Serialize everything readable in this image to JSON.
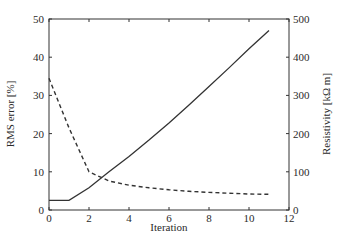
{
  "chart_data": {
    "type": "line",
    "title": "",
    "xlabel": "Iteration",
    "ylabel": "RMS error [%]",
    "ylabel_right": "Resistivity [kΩ m]",
    "xlim": [
      0,
      12
    ],
    "ylim": [
      0,
      50
    ],
    "ylim_right": [
      0,
      500
    ],
    "xticks": [
      0,
      2,
      4,
      6,
      8,
      10,
      12
    ],
    "yticks": [
      0,
      10,
      20,
      30,
      40,
      50
    ],
    "yticks_right": [
      0,
      100,
      200,
      300,
      400,
      500
    ],
    "grid": false,
    "legend": null,
    "series": [
      {
        "name": "RMS error",
        "axis": "left",
        "style": "dashed",
        "x": [
          0,
          1,
          2,
          3,
          4,
          5,
          6,
          7,
          8,
          9,
          10,
          11
        ],
        "values": [
          34.5,
          21.5,
          10.0,
          7.6,
          6.5,
          5.8,
          5.3,
          4.9,
          4.6,
          4.4,
          4.2,
          4.1
        ]
      },
      {
        "name": "Resistivity",
        "axis": "right",
        "style": "solid",
        "x": [
          0,
          1,
          2,
          3,
          4,
          5,
          6,
          7,
          8,
          9,
          10,
          11
        ],
        "values": [
          25,
          25,
          58,
          100,
          140,
          183,
          228,
          275,
          323,
          372,
          422,
          470
        ]
      }
    ]
  }
}
